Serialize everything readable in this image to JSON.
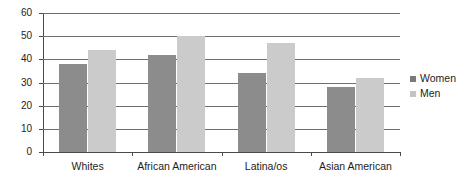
{
  "chart_data": {
    "type": "bar",
    "title": "",
    "subtitle": "",
    "xlabel": "",
    "ylabel": "",
    "categories": [
      "Whites",
      "African American",
      "Latina/os",
      "Asian American"
    ],
    "series": [
      {
        "name": "Women",
        "values": [
          38,
          42,
          34,
          28
        ],
        "color": "#8c8c8c"
      },
      {
        "name": "Men",
        "values": [
          44,
          50,
          47,
          32
        ],
        "color": "#cbcbcb"
      }
    ],
    "ylim": [
      0,
      60
    ],
    "ytick_step": 10,
    "yticks": [
      0,
      10,
      20,
      30,
      40,
      50,
      60
    ],
    "ytick_labels": [
      "0",
      "10",
      "20",
      "30",
      "40",
      "50",
      "60"
    ],
    "grid": true,
    "grid_axis": "y",
    "legend_position": "right",
    "annotations": []
  },
  "legend": {
    "entries": [
      {
        "label": "Women",
        "swatch": "#7a7a7a"
      },
      {
        "label": "Men",
        "swatch": "#c4c4c4"
      }
    ]
  },
  "colors": {
    "women_bar": "#8c8c8c",
    "men_bar": "#cbcbcb",
    "axis": "#4a4a4a",
    "gridline": "#6f6f6f",
    "text": "#1d1d1d",
    "background": "#ffffff"
  }
}
